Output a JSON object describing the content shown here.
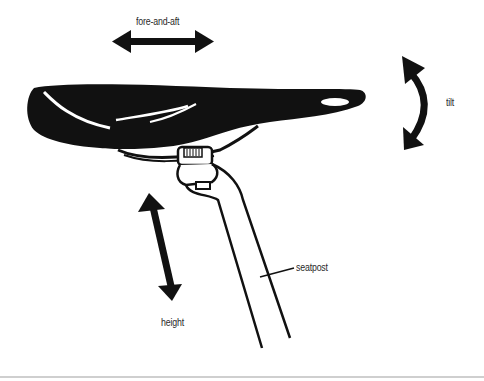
{
  "diagram": {
    "labels": {
      "fore_and_aft": "fore-and-aft",
      "tilt": "tilt",
      "seatpost": "seatpost",
      "height": "height"
    },
    "colors": {
      "ink": "#111111",
      "background": "#ffffff",
      "rule": "#cfcfcf"
    },
    "icons": {
      "fore_and_aft_arrow": "double-headed-horizontal-arrow",
      "tilt_arrow": "curved-double-headed-arrow",
      "height_arrow": "double-headed-diagonal-arrow"
    }
  }
}
